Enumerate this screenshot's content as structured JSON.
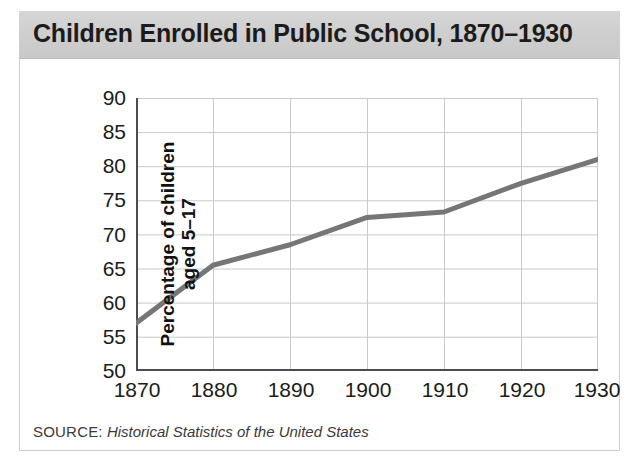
{
  "title": "Children Enrolled in Public School, 1870–1930",
  "source": {
    "label": "SOURCE:",
    "text": "Historical Statistics of the United States"
  },
  "axes": {
    "ylabel_line1": "Percentage of children",
    "ylabel_line2": "aged 5–17",
    "xlabel": ""
  },
  "colors": {
    "line": "#767676",
    "grid": "#c9c9c9",
    "axis": "#4d4d4d",
    "title_band": "#d0d0d0",
    "text": "#1b1b1b",
    "frame": "#cfcfcf"
  },
  "chart_data": {
    "type": "line",
    "title": "Children Enrolled in Public School, 1870–1930",
    "xlabel": "",
    "ylabel": "Percentage of children aged 5–17",
    "x": [
      1870,
      1880,
      1890,
      1900,
      1910,
      1920,
      1930
    ],
    "categories": [
      "1870",
      "1880",
      "1890",
      "1900",
      "1910",
      "1920",
      "1930"
    ],
    "values": [
      57,
      65.5,
      68.5,
      72.5,
      73.3,
      77.5,
      81
    ],
    "series": [
      {
        "name": "Percentage of children aged 5-17 enrolled",
        "values": [
          57,
          65.5,
          68.5,
          72.5,
          73.3,
          77.5,
          81
        ]
      }
    ],
    "xlim": [
      1870,
      1930
    ],
    "ylim": [
      50,
      90
    ],
    "yticks": [
      50,
      55,
      60,
      65,
      70,
      75,
      80,
      85,
      90
    ],
    "ytick_labels": [
      "50",
      "55",
      "60",
      "65",
      "70",
      "75",
      "80",
      "85",
      "90"
    ],
    "xticks": [
      1870,
      1880,
      1890,
      1900,
      1910,
      1920,
      1930
    ],
    "xtick_labels": [
      "1870",
      "1880",
      "1890",
      "1900",
      "1910",
      "1920",
      "1930"
    ],
    "grid": true,
    "legend": false,
    "legend_position": "none",
    "annotations": [],
    "source": "Historical Statistics of the United States"
  }
}
